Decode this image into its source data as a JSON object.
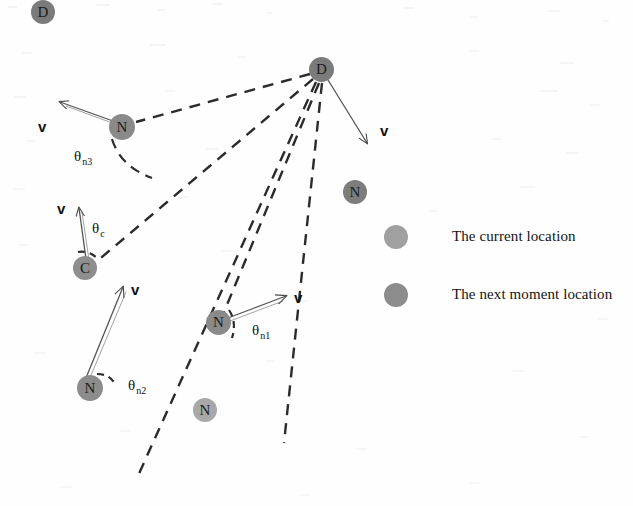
{
  "figure": {
    "width": 633,
    "height": 506,
    "background": "#fefefe"
  },
  "colors": {
    "node_next_moment": "#7b7b7b",
    "node_current": "#a8a8a8",
    "dashed_line": "#2b2b2b",
    "vector_line": "#555555",
    "text": "#111111",
    "legend_current": "#a0a0a0",
    "legend_next": "#8c8c8c"
  },
  "nodes": [
    {
      "id": "d-top-left",
      "glyph": "D",
      "x": 43,
      "y": 12,
      "r": 12,
      "kind": "next_moment"
    },
    {
      "id": "d-main",
      "glyph": "D",
      "x": 322,
      "y": 70,
      "r": 12.5,
      "kind": "next_moment"
    },
    {
      "id": "n3",
      "glyph": "N",
      "x": 122,
      "y": 127,
      "r": 13,
      "kind": "next_moment"
    },
    {
      "id": "n-right",
      "glyph": "N",
      "x": 355,
      "y": 192,
      "r": 12,
      "kind": "next_moment"
    },
    {
      "id": "c",
      "glyph": "C",
      "x": 85,
      "y": 268,
      "r": 12,
      "kind": "next_moment"
    },
    {
      "id": "n1",
      "glyph": "N",
      "x": 218,
      "y": 322,
      "r": 12.5,
      "kind": "next_moment"
    },
    {
      "id": "n2",
      "glyph": "N",
      "x": 90,
      "y": 388,
      "r": 13,
      "kind": "next_moment"
    },
    {
      "id": "n-bottom",
      "glyph": "N",
      "x": 205,
      "y": 410,
      "r": 12,
      "kind": "current"
    }
  ],
  "vector_labels": [
    {
      "id": "v-n3",
      "text": "v",
      "x": 38,
      "y": 118
    },
    {
      "id": "v-d",
      "text": "v",
      "x": 380,
      "y": 122
    },
    {
      "id": "v-c",
      "text": "v",
      "x": 57,
      "y": 200
    },
    {
      "id": "v-n1",
      "text": "v",
      "x": 294,
      "y": 289
    },
    {
      "id": "v-n2",
      "text": "v",
      "x": 131,
      "y": 281
    }
  ],
  "angle_labels": [
    {
      "id": "theta-n3",
      "symbol": "θ",
      "sub": "n3",
      "x": 74,
      "y": 148
    },
    {
      "id": "theta-c",
      "symbol": "θ",
      "sub": "c",
      "x": 92,
      "y": 220
    },
    {
      "id": "theta-n1",
      "symbol": "θ",
      "sub": "n1",
      "x": 252,
      "y": 322
    },
    {
      "id": "theta-n2",
      "symbol": "θ",
      "sub": "n2",
      "x": 128,
      "y": 377
    }
  ],
  "legend": {
    "items": [
      {
        "id": "legend-current",
        "label": "The current location",
        "dot_x": 396,
        "dot_y": 237,
        "dot_r": 12,
        "text_x": 452,
        "text_y": 228
      },
      {
        "id": "legend-next",
        "label": "The next moment location",
        "dot_x": 396,
        "dot_y": 295,
        "dot_r": 12,
        "text_x": 452,
        "text_y": 286
      }
    ]
  }
}
